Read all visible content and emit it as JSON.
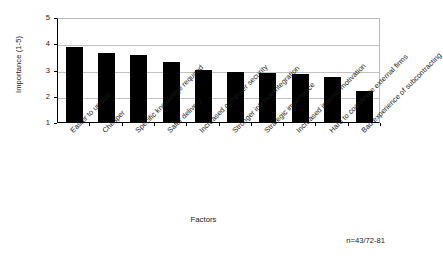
{
  "chart_data": {
    "type": "bar",
    "title": "",
    "subtitle": "",
    "xlabel": "Factors",
    "ylabel": "Importance (1-5)",
    "ylim": [
      1,
      5
    ],
    "yticks": [
      1,
      2,
      3,
      4,
      5
    ],
    "grid": true,
    "legend": null,
    "orientation": "vertical",
    "bar_color": "#000000",
    "categories": [
      "Easier to update",
      "Cheaper",
      "Specific knowledge required",
      "Safer delivery",
      "Increased computer security",
      "Stronger internal integration",
      "Strategic importance",
      "Increased internal motivation",
      "Hard to coordinate external firms",
      "Bad experience of subcontracting"
    ],
    "values": [
      3.87,
      3.62,
      3.57,
      3.27,
      3.0,
      2.92,
      2.88,
      2.83,
      2.71,
      2.18
    ],
    "annotations": [
      {
        "text": "n=43/72-81",
        "position": "bottom-right"
      }
    ]
  },
  "axis": {
    "y_title": "Importance (1-5)",
    "x_title": "Factors",
    "y_tick_labels": [
      "5",
      "4",
      "3",
      "2",
      "1"
    ]
  },
  "note": {
    "sample_size": "n=43/72-81"
  }
}
